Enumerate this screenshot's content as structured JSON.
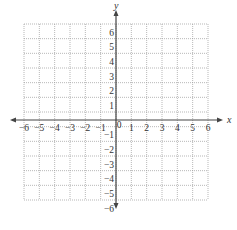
{
  "diagram": {
    "type": "coordinate-plane",
    "x_axis": {
      "label": "x",
      "min": -6,
      "max": 6,
      "ticks": [
        "-6",
        "-5",
        "-4",
        "-3",
        "-2",
        "-1",
        "0",
        "1",
        "2",
        "3",
        "4",
        "5",
        "6"
      ]
    },
    "y_axis": {
      "label": "y",
      "min": -6,
      "max": 6,
      "ticks": [
        "6",
        "5",
        "4",
        "3",
        "2",
        "1",
        "-1",
        "-2",
        "-3",
        "-4",
        "-5",
        "-6"
      ]
    },
    "grid": {
      "style": "dotted",
      "cells_x": 12,
      "cells_y": 12
    },
    "colors": {
      "axis": "#444444",
      "grid": "#999999",
      "text": "#333333"
    }
  }
}
